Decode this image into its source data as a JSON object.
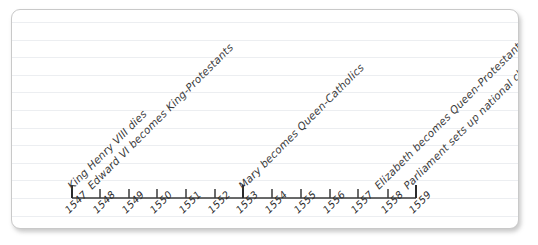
{
  "chart_data": {
    "type": "timeline",
    "title": "",
    "xlabel": "",
    "ylabel": "",
    "xlim": [
      1547,
      1559
    ],
    "grid": "ruled-paper-horizontal-lines",
    "legend": "none",
    "categories": [
      "1547",
      "1548",
      "1549",
      "1550",
      "1551",
      "1552",
      "1553",
      "1554",
      "1555",
      "1556",
      "1557",
      "1558",
      "1559"
    ],
    "tick_labels": [
      "1547",
      "1548",
      "1549",
      "1550",
      "1551",
      "1552",
      "1553",
      "1554",
      "1555",
      "1556",
      "1557",
      "1558",
      "1559"
    ],
    "major_ticks": [
      "1547",
      "1553",
      "1559"
    ],
    "events": [
      {
        "year": "1547",
        "label": "King Henry VIII dies"
      },
      {
        "year": "1547",
        "label": "Edward VI becomes King-Protestants"
      },
      {
        "year": "1553",
        "label": "Mary becomes Queen-Catholics"
      },
      {
        "year": "1558",
        "label": "Elizabeth becomes Queen-Protestants"
      },
      {
        "year": "1559",
        "label": "Parliament sets up national church"
      }
    ],
    "annotation_angle_degrees": -45,
    "tick_label_angle_degrees": -45
  },
  "colors": {
    "paper": "#ffffff",
    "paper_border": "#c9c9c9",
    "rule_line": "#eceef1",
    "axis": "#3a3a3a",
    "text": "#2c2c2c",
    "page_background": "#ffffff"
  },
  "axis": {
    "ticks": [
      {
        "label": "1547",
        "x": 60,
        "major": true
      },
      {
        "label": "1548",
        "x": 88,
        "major": false
      },
      {
        "label": "1549",
        "x": 117,
        "major": false
      },
      {
        "label": "1550",
        "x": 145,
        "major": false
      },
      {
        "label": "1551",
        "x": 174,
        "major": false
      },
      {
        "label": "1552",
        "x": 203,
        "major": false
      },
      {
        "label": "1553",
        "x": 231,
        "major": true
      },
      {
        "label": "1554",
        "x": 260,
        "major": false
      },
      {
        "label": "1555",
        "x": 289,
        "major": false
      },
      {
        "label": "1556",
        "x": 318,
        "major": false
      },
      {
        "label": "1557",
        "x": 346,
        "major": false
      },
      {
        "label": "1558",
        "x": 376,
        "major": false
      },
      {
        "label": "1559",
        "x": 404,
        "major": true
      }
    ]
  },
  "annotations": [
    {
      "name": "henry-viii-dies",
      "text": "King Henry VIII dies",
      "x": 60,
      "y": 180
    },
    {
      "name": "edward-vi-king",
      "text": "Edward VI becomes King-Protestants",
      "x": 80,
      "y": 180
    },
    {
      "name": "mary-queen",
      "text": "Mary becomes Queen-Catholics",
      "x": 231,
      "y": 180
    },
    {
      "name": "elizabeth-queen",
      "text": "Elizabeth becomes Queen-Protestants",
      "x": 367,
      "y": 180
    },
    {
      "name": "parliament-church",
      "text": "Parliament sets up national church",
      "x": 396,
      "y": 180
    }
  ]
}
